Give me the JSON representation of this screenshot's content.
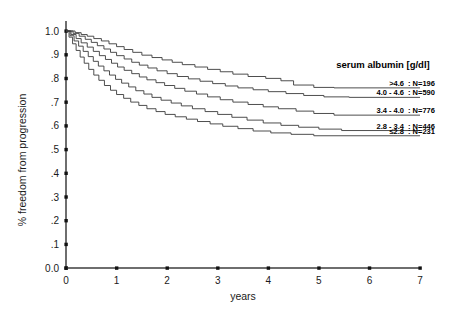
{
  "chart_data": {
    "type": "line",
    "title": "",
    "xlabel": "years",
    "ylabel": "% freedom from progression",
    "xlim": [
      0,
      7
    ],
    "ylim": [
      0,
      1
    ],
    "grid": false,
    "legend_position": "right",
    "legend_title": "serum albumin [g/dl]",
    "xticks": [
      "0",
      "1",
      "2",
      "3",
      "4",
      "5",
      "6",
      "7"
    ],
    "xtick_values": [
      0,
      1,
      2,
      3,
      4,
      5,
      6,
      7
    ],
    "yticks": [
      "0.0",
      ".1",
      ".2",
      ".3",
      ".4",
      ".5",
      ".6",
      ".7",
      ".8",
      ".9",
      "1.0"
    ],
    "ytick_values": [
      0,
      0.1,
      0.2,
      0.3,
      0.4,
      0.5,
      0.6,
      0.7,
      0.8,
      0.9,
      1.0
    ],
    "series": [
      {
        "name": ">4.6",
        "n_label": ": N=196",
        "n": 196,
        "final_value": 0.76,
        "points": [
          [
            0.0,
            1.0
          ],
          [
            0.18,
            1.0
          ],
          [
            0.18,
            0.993
          ],
          [
            0.3,
            0.993
          ],
          [
            0.3,
            0.985
          ],
          [
            0.42,
            0.985
          ],
          [
            0.42,
            0.978
          ],
          [
            0.55,
            0.978
          ],
          [
            0.55,
            0.968
          ],
          [
            0.7,
            0.968
          ],
          [
            0.7,
            0.958
          ],
          [
            0.85,
            0.958
          ],
          [
            0.85,
            0.946
          ],
          [
            1.0,
            0.946
          ],
          [
            1.0,
            0.934
          ],
          [
            1.15,
            0.934
          ],
          [
            1.15,
            0.922
          ],
          [
            1.32,
            0.922
          ],
          [
            1.32,
            0.91
          ],
          [
            1.5,
            0.91
          ],
          [
            1.5,
            0.898
          ],
          [
            1.7,
            0.898
          ],
          [
            1.7,
            0.888
          ],
          [
            1.9,
            0.888
          ],
          [
            1.9,
            0.878
          ],
          [
            2.1,
            0.878
          ],
          [
            2.1,
            0.868
          ],
          [
            2.3,
            0.868
          ],
          [
            2.3,
            0.858
          ],
          [
            2.55,
            0.858
          ],
          [
            2.55,
            0.848
          ],
          [
            2.8,
            0.848
          ],
          [
            2.8,
            0.838
          ],
          [
            3.05,
            0.838
          ],
          [
            3.05,
            0.828
          ],
          [
            3.3,
            0.828
          ],
          [
            3.3,
            0.818
          ],
          [
            3.6,
            0.818
          ],
          [
            3.6,
            0.808
          ],
          [
            3.95,
            0.808
          ],
          [
            3.95,
            0.8
          ],
          [
            4.25,
            0.8
          ],
          [
            4.25,
            0.79
          ],
          [
            4.5,
            0.79
          ],
          [
            4.5,
            0.772
          ],
          [
            4.9,
            0.772
          ],
          [
            4.9,
            0.762
          ],
          [
            5.3,
            0.762
          ],
          [
            5.3,
            0.76
          ],
          [
            7.0,
            0.76
          ]
        ]
      },
      {
        "name": "4.0 - 4.6",
        "n_label": ": N=590",
        "n": 590,
        "final_value": 0.72,
        "points": [
          [
            0.0,
            1.0
          ],
          [
            0.14,
            1.0
          ],
          [
            0.14,
            0.99
          ],
          [
            0.26,
            0.99
          ],
          [
            0.26,
            0.978
          ],
          [
            0.38,
            0.978
          ],
          [
            0.38,
            0.965
          ],
          [
            0.5,
            0.965
          ],
          [
            0.5,
            0.952
          ],
          [
            0.62,
            0.952
          ],
          [
            0.62,
            0.938
          ],
          [
            0.75,
            0.938
          ],
          [
            0.75,
            0.924
          ],
          [
            0.88,
            0.924
          ],
          [
            0.88,
            0.91
          ],
          [
            1.0,
            0.91
          ],
          [
            1.0,
            0.896
          ],
          [
            1.15,
            0.896
          ],
          [
            1.15,
            0.882
          ],
          [
            1.3,
            0.882
          ],
          [
            1.3,
            0.868
          ],
          [
            1.45,
            0.868
          ],
          [
            1.45,
            0.856
          ],
          [
            1.62,
            0.856
          ],
          [
            1.62,
            0.844
          ],
          [
            1.8,
            0.844
          ],
          [
            1.8,
            0.832
          ],
          [
            2.0,
            0.832
          ],
          [
            2.0,
            0.82
          ],
          [
            2.2,
            0.82
          ],
          [
            2.2,
            0.808
          ],
          [
            2.42,
            0.808
          ],
          [
            2.42,
            0.798
          ],
          [
            2.65,
            0.798
          ],
          [
            2.65,
            0.788
          ],
          [
            2.9,
            0.788
          ],
          [
            2.9,
            0.778
          ],
          [
            3.15,
            0.778
          ],
          [
            3.15,
            0.768
          ],
          [
            3.4,
            0.768
          ],
          [
            3.4,
            0.76
          ],
          [
            3.7,
            0.76
          ],
          [
            3.7,
            0.752
          ],
          [
            4.0,
            0.752
          ],
          [
            4.0,
            0.744
          ],
          [
            4.35,
            0.744
          ],
          [
            4.35,
            0.736
          ],
          [
            4.7,
            0.736
          ],
          [
            4.7,
            0.728
          ],
          [
            5.1,
            0.728
          ],
          [
            5.1,
            0.722
          ],
          [
            5.6,
            0.722
          ],
          [
            5.6,
            0.72
          ],
          [
            7.0,
            0.72
          ]
        ]
      },
      {
        "name": "3.4 - 4.0",
        "n_label": ": N=776",
        "n": 776,
        "final_value": 0.645,
        "points": [
          [
            0.0,
            1.0
          ],
          [
            0.1,
            1.0
          ],
          [
            0.1,
            0.985
          ],
          [
            0.2,
            0.985
          ],
          [
            0.2,
            0.968
          ],
          [
            0.3,
            0.968
          ],
          [
            0.3,
            0.95
          ],
          [
            0.42,
            0.95
          ],
          [
            0.42,
            0.932
          ],
          [
            0.54,
            0.932
          ],
          [
            0.54,
            0.914
          ],
          [
            0.66,
            0.914
          ],
          [
            0.66,
            0.896
          ],
          [
            0.78,
            0.896
          ],
          [
            0.78,
            0.88
          ],
          [
            0.9,
            0.88
          ],
          [
            0.9,
            0.864
          ],
          [
            1.02,
            0.864
          ],
          [
            1.02,
            0.848
          ],
          [
            1.15,
            0.848
          ],
          [
            1.15,
            0.834
          ],
          [
            1.3,
            0.834
          ],
          [
            1.3,
            0.82
          ],
          [
            1.45,
            0.82
          ],
          [
            1.45,
            0.806
          ],
          [
            1.6,
            0.806
          ],
          [
            1.6,
            0.794
          ],
          [
            1.78,
            0.794
          ],
          [
            1.78,
            0.782
          ],
          [
            1.95,
            0.782
          ],
          [
            1.95,
            0.77
          ],
          [
            2.15,
            0.77
          ],
          [
            2.15,
            0.758
          ],
          [
            2.35,
            0.758
          ],
          [
            2.35,
            0.746
          ],
          [
            2.58,
            0.746
          ],
          [
            2.58,
            0.734
          ],
          [
            2.8,
            0.734
          ],
          [
            2.8,
            0.722
          ],
          [
            3.05,
            0.722
          ],
          [
            3.05,
            0.71
          ],
          [
            3.3,
            0.71
          ],
          [
            3.3,
            0.7
          ],
          [
            3.6,
            0.7
          ],
          [
            3.6,
            0.69
          ],
          [
            3.9,
            0.69
          ],
          [
            3.9,
            0.68
          ],
          [
            4.2,
            0.68
          ],
          [
            4.2,
            0.672
          ],
          [
            4.55,
            0.672
          ],
          [
            4.55,
            0.662
          ],
          [
            4.9,
            0.662
          ],
          [
            4.9,
            0.652
          ],
          [
            5.3,
            0.652
          ],
          [
            5.3,
            0.645
          ],
          [
            7.0,
            0.645
          ]
        ]
      },
      {
        "name": "2.8 - 3.4",
        "n_label": ": N=446",
        "n": 446,
        "final_value": 0.58,
        "points": [
          [
            0.0,
            1.0
          ],
          [
            0.08,
            1.0
          ],
          [
            0.08,
            0.98
          ],
          [
            0.16,
            0.98
          ],
          [
            0.16,
            0.958
          ],
          [
            0.25,
            0.958
          ],
          [
            0.25,
            0.936
          ],
          [
            0.34,
            0.936
          ],
          [
            0.34,
            0.914
          ],
          [
            0.44,
            0.914
          ],
          [
            0.44,
            0.892
          ],
          [
            0.54,
            0.892
          ],
          [
            0.54,
            0.872
          ],
          [
            0.64,
            0.872
          ],
          [
            0.64,
            0.852
          ],
          [
            0.75,
            0.852
          ],
          [
            0.75,
            0.832
          ],
          [
            0.86,
            0.832
          ],
          [
            0.86,
            0.814
          ],
          [
            0.98,
            0.814
          ],
          [
            0.98,
            0.796
          ],
          [
            1.1,
            0.796
          ],
          [
            1.1,
            0.78
          ],
          [
            1.24,
            0.78
          ],
          [
            1.24,
            0.764
          ],
          [
            1.38,
            0.764
          ],
          [
            1.38,
            0.748
          ],
          [
            1.54,
            0.748
          ],
          [
            1.54,
            0.734
          ],
          [
            1.7,
            0.734
          ],
          [
            1.7,
            0.72
          ],
          [
            1.88,
            0.72
          ],
          [
            1.88,
            0.708
          ],
          [
            2.08,
            0.708
          ],
          [
            2.08,
            0.696
          ],
          [
            2.28,
            0.696
          ],
          [
            2.28,
            0.684
          ],
          [
            2.5,
            0.684
          ],
          [
            2.5,
            0.672
          ],
          [
            2.75,
            0.672
          ],
          [
            2.75,
            0.66
          ],
          [
            3.0,
            0.66
          ],
          [
            3.0,
            0.648
          ],
          [
            3.28,
            0.648
          ],
          [
            3.28,
            0.636
          ],
          [
            3.58,
            0.636
          ],
          [
            3.58,
            0.624
          ],
          [
            3.9,
            0.624
          ],
          [
            3.9,
            0.612
          ],
          [
            4.25,
            0.612
          ],
          [
            4.25,
            0.602
          ],
          [
            4.6,
            0.602
          ],
          [
            4.6,
            0.594
          ],
          [
            5.0,
            0.594
          ],
          [
            5.0,
            0.586
          ],
          [
            5.45,
            0.586
          ],
          [
            5.45,
            0.58
          ],
          [
            7.0,
            0.58
          ]
        ]
      },
      {
        "name": "≤2.8",
        "n_label": ": N=231",
        "n": 231,
        "final_value": 0.558,
        "points": [
          [
            0.0,
            1.0
          ],
          [
            0.06,
            1.0
          ],
          [
            0.06,
            0.974
          ],
          [
            0.13,
            0.974
          ],
          [
            0.13,
            0.946
          ],
          [
            0.2,
            0.946
          ],
          [
            0.2,
            0.918
          ],
          [
            0.28,
            0.918
          ],
          [
            0.28,
            0.89
          ],
          [
            0.36,
            0.89
          ],
          [
            0.36,
            0.864
          ],
          [
            0.45,
            0.864
          ],
          [
            0.45,
            0.838
          ],
          [
            0.55,
            0.838
          ],
          [
            0.55,
            0.814
          ],
          [
            0.65,
            0.814
          ],
          [
            0.65,
            0.792
          ],
          [
            0.76,
            0.792
          ],
          [
            0.76,
            0.77
          ],
          [
            0.88,
            0.77
          ],
          [
            0.88,
            0.75
          ],
          [
            1.0,
            0.75
          ],
          [
            1.0,
            0.732
          ],
          [
            1.14,
            0.732
          ],
          [
            1.14,
            0.716
          ],
          [
            1.28,
            0.716
          ],
          [
            1.28,
            0.7
          ],
          [
            1.44,
            0.7
          ],
          [
            1.44,
            0.686
          ],
          [
            1.6,
            0.686
          ],
          [
            1.6,
            0.672
          ],
          [
            1.78,
            0.672
          ],
          [
            1.78,
            0.66
          ],
          [
            1.96,
            0.66
          ],
          [
            1.96,
            0.648
          ],
          [
            2.16,
            0.648
          ],
          [
            2.16,
            0.638
          ],
          [
            2.38,
            0.638
          ],
          [
            2.38,
            0.628
          ],
          [
            2.6,
            0.628
          ],
          [
            2.6,
            0.618
          ],
          [
            2.85,
            0.618
          ],
          [
            2.85,
            0.608
          ],
          [
            3.1,
            0.608
          ],
          [
            3.1,
            0.598
          ],
          [
            3.4,
            0.598
          ],
          [
            3.4,
            0.588
          ],
          [
            3.7,
            0.588
          ],
          [
            3.7,
            0.578
          ],
          [
            4.05,
            0.578
          ],
          [
            4.05,
            0.57
          ],
          [
            4.45,
            0.57
          ],
          [
            4.45,
            0.564
          ],
          [
            4.9,
            0.564
          ],
          [
            4.9,
            0.558
          ],
          [
            7.0,
            0.558
          ]
        ]
      }
    ]
  },
  "legend": {
    "title": "serum albumin [g/dl]",
    "entries": [
      {
        "key": ">4.6",
        "value": ": N=196"
      },
      {
        "key": "4.0 - 4.6",
        "value": ": N=590"
      },
      {
        "key": "3.4 - 4.0",
        "value": ": N=776"
      },
      {
        "key": "2.8 - 3.4",
        "value": ": N=446"
      },
      {
        "key": "≤2.8",
        "value": ": N=231"
      }
    ]
  },
  "axes": {
    "x_title": "years",
    "y_title": "% freedom from progression"
  },
  "colors": {
    "background": "#ffffff",
    "curve": "#3a3a3a",
    "axis": "#6e6e6e",
    "text": "#1a1a1a"
  }
}
